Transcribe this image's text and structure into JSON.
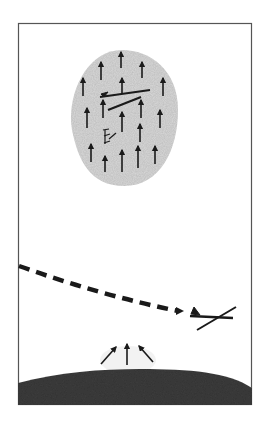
{
  "figure": {
    "colors": {
      "background": "#ffffff",
      "frame": "#555555",
      "thermal_fill": "#d9d9d9",
      "ink": "#1a1a1a",
      "ground": "#3c3c3c"
    },
    "frame": {
      "x": 18,
      "y": 23,
      "width": 234,
      "height": 382
    },
    "thermal": {
      "label": "thermal-bubble",
      "arrows": [
        {
          "x": 121,
          "y1": 68,
          "y2": 52
        },
        {
          "x": 101,
          "y1": 80,
          "y2": 62
        },
        {
          "x": 142,
          "y1": 78,
          "y2": 62
        },
        {
          "x": 83,
          "y1": 96,
          "y2": 78
        },
        {
          "x": 122,
          "y1": 94,
          "y2": 78
        },
        {
          "x": 163,
          "y1": 96,
          "y2": 78
        },
        {
          "x": 103,
          "y1": 118,
          "y2": 100
        },
        {
          "x": 141,
          "y1": 118,
          "y2": 100
        },
        {
          "x": 87,
          "y1": 128,
          "y2": 108
        },
        {
          "x": 160,
          "y1": 128,
          "y2": 110
        },
        {
          "x": 122,
          "y1": 132,
          "y2": 112
        },
        {
          "x": 140,
          "y1": 142,
          "y2": 124
        },
        {
          "x": 91,
          "y1": 162,
          "y2": 144
        },
        {
          "x": 155,
          "y1": 164,
          "y2": 146
        },
        {
          "x": 105,
          "y1": 172,
          "y2": 156
        },
        {
          "x": 122,
          "y1": 172,
          "y2": 150
        },
        {
          "x": 138,
          "y1": 168,
          "y2": 146
        }
      ]
    },
    "ground_arrows": [
      {
        "x1": 101,
        "y1": 364,
        "x2": 116,
        "y2": 347
      },
      {
        "x1": 127,
        "y1": 365,
        "x2": 127,
        "y2": 344
      },
      {
        "x1": 153,
        "y1": 362,
        "x2": 139,
        "y2": 346
      }
    ]
  }
}
